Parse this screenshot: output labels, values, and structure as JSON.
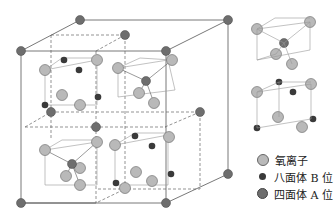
{
  "figure": {
    "type": "spinel crystal structure diagram",
    "colors": {
      "oxygen": "#b9b9b9",
      "octahedral_B": "#3a3a3a",
      "tetrahedral_A": "#6e6e6e",
      "line": "#555555"
    }
  },
  "legend": {
    "items": [
      {
        "label": "氧离子",
        "kind": "oxygen"
      },
      {
        "label": "八面体 B 位",
        "kind": "octahedral_B"
      },
      {
        "label": "四面体 A 位",
        "kind": "tetrahedral_A"
      }
    ]
  }
}
